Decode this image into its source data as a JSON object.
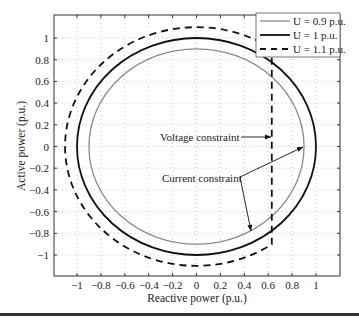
{
  "chart_data": {
    "type": "line",
    "title": "",
    "xlabel": "Reactive power (p.u.)",
    "ylabel": "Active power (p.u.)",
    "xlim": [
      -1.18,
      1.18
    ],
    "ylim": [
      -1.2,
      1.2
    ],
    "grid": true,
    "legend_position": "upper right",
    "x_ticks": [
      -1,
      -0.8,
      -0.6,
      -0.4,
      -0.2,
      0,
      0.2,
      0.4,
      0.6,
      0.8,
      1
    ],
    "x_tick_labels": [
      "−1",
      "−0.8",
      "−0.6",
      "−0.4",
      "−0.2",
      "0",
      "0.2",
      "0.4",
      "0.6",
      "0.8",
      "1"
    ],
    "y_ticks": [
      1,
      0.8,
      0.6,
      0.4,
      0.2,
      0,
      -0.2,
      -0.4,
      -0.6,
      -0.8,
      -1
    ],
    "y_tick_labels": [
      "1",
      "0.8",
      "0.6",
      "0.4",
      "0.2",
      "0",
      "−0.2",
      "−0.4",
      "−0.6",
      "−0.8",
      "−1"
    ],
    "series": [
      {
        "name": "U = 0.9 p.u.",
        "shape": "circle",
        "radius": 0.9,
        "color": "#8a8a8a",
        "style": "solid",
        "width": 1.3
      },
      {
        "name": "U = 1 p.u.",
        "shape": "circle",
        "radius": 1.0,
        "color": "#111111",
        "style": "solid",
        "width": 1.8
      },
      {
        "name": "U = 1.1 p.u.",
        "shape": "circle-clipped",
        "radius": 1.1,
        "clip_x": 0.63,
        "color": "#111111",
        "style": "dashed",
        "width": 1.8
      }
    ],
    "annotations": [
      {
        "text": "Voltage constraint",
        "x": -0.3,
        "y": 0.03,
        "arrow_to": [
          [
            0.63,
            0.03
          ]
        ]
      },
      {
        "text": "Current constraint",
        "x": -0.29,
        "y": -0.29,
        "arrow_to": [
          [
            0.88,
            0.0
          ],
          [
            0.45,
            -0.77
          ]
        ]
      }
    ]
  },
  "legend": {
    "items": [
      {
        "label": "U = 0.9 p.u."
      },
      {
        "label": "U = 1 p.u."
      },
      {
        "label": "U = 1.1 p.u."
      }
    ]
  },
  "annotations": {
    "voltage": "Voltage constraint",
    "current": "Current constraint"
  },
  "axes": {
    "xlabel": "Reactive power (p.u.)",
    "ylabel": "Active power (p.u.)"
  }
}
